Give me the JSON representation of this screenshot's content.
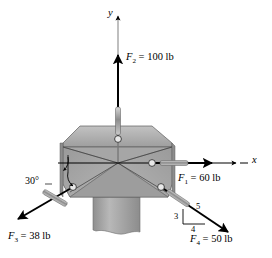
{
  "figure": {
    "background_color": "#ffffff",
    "plate_color": "#a8a8a8",
    "line_color": "#000000",
    "axis_color": "#000000"
  },
  "axes": {
    "y_label": "y",
    "x_label": "x"
  },
  "forces": [
    {
      "id": "F1",
      "name_html": "F",
      "subscript": "1",
      "label": "F₁ = 60 lb",
      "value": 60,
      "unit": "lb",
      "direction": "+x",
      "angle_deg": 0
    },
    {
      "id": "F2",
      "name_html": "F",
      "subscript": "2",
      "label": "F₂ = 100 lb",
      "value": 100,
      "unit": "lb",
      "direction": "+y",
      "angle_deg": 90
    },
    {
      "id": "F3",
      "name_html": "F",
      "subscript": "3",
      "label": "F₃ = 38 lb",
      "value": 38,
      "unit": "lb",
      "direction": "third quadrant",
      "angle_deg": 210
    },
    {
      "id": "F4",
      "name_html": "F",
      "subscript": "4",
      "label": "F₄ = 50 lb",
      "value": 50,
      "unit": "lb",
      "direction": "fourth quadrant",
      "slope": "3-4-5"
    }
  ],
  "annotations": {
    "angle_f3": "30°",
    "slope_vertical": "3",
    "slope_horizontal": "4",
    "slope_hypotenuse": "5"
  },
  "labels": {
    "f1_prefix": "F",
    "f1_sub": "1",
    "f1_rest": " = 60 lb",
    "f2_prefix": "F",
    "f2_sub": "2",
    "f2_rest": " = 100 lb",
    "f3_prefix": "F",
    "f3_sub": "3",
    "f3_rest": " = 38 lb",
    "f4_prefix": "F",
    "f4_sub": "4",
    "f4_rest": " = 50 lb"
  }
}
